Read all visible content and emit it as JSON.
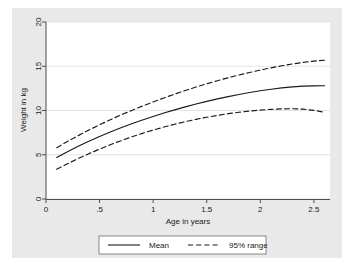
{
  "chart_data": {
    "type": "line",
    "title": "",
    "xlabel": "Age in years",
    "ylabel": "Weight in kg",
    "xlim": [
      0,
      2.65
    ],
    "ylim": [
      0,
      20
    ],
    "grid": "horizontal",
    "xticks": [
      0,
      0.5,
      1,
      1.5,
      2,
      2.5
    ],
    "xticklabels": [
      "0",
      ".5",
      "1",
      "1.5",
      "2",
      "2.5"
    ],
    "yticks": [
      0,
      5,
      10,
      15,
      20
    ],
    "yticklabels": [
      "0",
      "5",
      "10",
      "15",
      "20"
    ],
    "legend_position": "below",
    "x": [
      0.1,
      0.2,
      0.3,
      0.4,
      0.5,
      0.6,
      0.7,
      0.8,
      0.9,
      1.0,
      1.1,
      1.2,
      1.3,
      1.4,
      1.5,
      1.6,
      1.7,
      1.8,
      1.9,
      2.0,
      2.1,
      2.2,
      2.3,
      2.4,
      2.5,
      2.6
    ],
    "series": [
      {
        "name": "Mean",
        "style": "solid",
        "color": "#1a1a1a",
        "values": [
          4.7,
          5.35,
          5.95,
          6.52,
          7.06,
          7.57,
          8.05,
          8.5,
          8.93,
          9.33,
          9.71,
          10.07,
          10.41,
          10.73,
          11.03,
          11.31,
          11.57,
          11.81,
          12.03,
          12.23,
          12.4,
          12.55,
          12.67,
          12.75,
          12.79,
          12.8
        ]
      },
      {
        "name": "95% range",
        "style": "dashed",
        "color": "#1a1a1a",
        "bound": "upper",
        "values": [
          5.8,
          6.5,
          7.16,
          7.79,
          8.39,
          8.96,
          9.5,
          10.01,
          10.5,
          10.97,
          11.42,
          11.85,
          12.26,
          12.65,
          13.02,
          13.37,
          13.7,
          14.01,
          14.3,
          14.57,
          14.82,
          15.05,
          15.26,
          15.44,
          15.58,
          15.68
        ]
      },
      {
        "name": "95% range",
        "style": "dashed",
        "color": "#1a1a1a",
        "bound": "lower",
        "values": [
          3.35,
          3.98,
          4.57,
          5.12,
          5.64,
          6.13,
          6.59,
          7.02,
          7.42,
          7.79,
          8.13,
          8.45,
          8.74,
          9.0,
          9.24,
          9.45,
          9.64,
          9.8,
          9.94,
          10.05,
          10.13,
          10.18,
          10.2,
          10.15,
          10.02,
          9.8
        ]
      }
    ],
    "legend": [
      {
        "label": "Mean",
        "style": "solid"
      },
      {
        "label": "95% range",
        "style": "dashed"
      }
    ]
  },
  "axes": {
    "x_title": "Age in years",
    "y_title": "Weight in kg",
    "x_tick_0": "0",
    "x_tick_1": ".5",
    "x_tick_2": "1",
    "x_tick_3": "1.5",
    "x_tick_4": "2",
    "x_tick_5": "2.5",
    "y_tick_0": "0",
    "y_tick_1": "5",
    "y_tick_2": "10",
    "y_tick_3": "15",
    "y_tick_4": "20"
  },
  "legend": {
    "mean_label": "Mean",
    "range_label": "95% range"
  },
  "colors": {
    "graph_background": "#e9e9e9",
    "plot_background": "#ffffff",
    "line": "#1a1a1a",
    "grid": "#e0e0e0",
    "axis": "#4d4d4d"
  }
}
